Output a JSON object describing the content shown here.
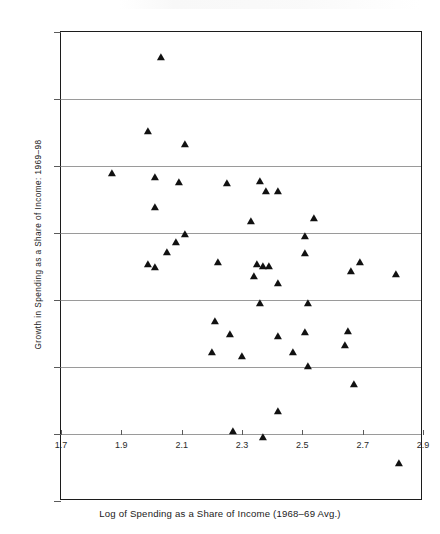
{
  "chart_data": {
    "type": "scatter",
    "title": "",
    "xlabel": "Log of Spending as a Share of Income (1968–69 Avg.)",
    "ylabel": "Growth in Spending as  a  Share of Income: 1969–98",
    "xlim": [
      1.7,
      2.9
    ],
    "ylim": [
      -10,
      60
    ],
    "xticks": [
      "1.7",
      "1.9",
      "2.1",
      "2.3",
      "2.5",
      "2.7",
      "2.9"
    ],
    "xtick_values": [
      1.7,
      1.9,
      2.1,
      2.3,
      2.5,
      2.7,
      2.9
    ],
    "yticks": [
      "60%",
      "50%",
      "40%",
      "30%",
      "20%",
      "10%",
      "0%",
      "-10%"
    ],
    "ytick_values": [
      60,
      50,
      40,
      30,
      20,
      10,
      0,
      -10
    ],
    "grid": "horizontal",
    "legend": "none",
    "marker": "filled-triangle",
    "marker_color": "#111111",
    "points": [
      {
        "x": 2.03,
        "y": 56.2
      },
      {
        "x": 1.99,
        "y": 45.2
      },
      {
        "x": 2.11,
        "y": 43.3
      },
      {
        "x": 1.87,
        "y": 38.9
      },
      {
        "x": 2.01,
        "y": 38.4
      },
      {
        "x": 2.09,
        "y": 37.6
      },
      {
        "x": 2.25,
        "y": 37.4
      },
      {
        "x": 2.36,
        "y": 37.8
      },
      {
        "x": 2.38,
        "y": 36.3
      },
      {
        "x": 2.42,
        "y": 36.3
      },
      {
        "x": 2.01,
        "y": 33.9
      },
      {
        "x": 2.33,
        "y": 31.8
      },
      {
        "x": 2.54,
        "y": 32.2
      },
      {
        "x": 2.11,
        "y": 29.8
      },
      {
        "x": 2.08,
        "y": 28.6
      },
      {
        "x": 2.05,
        "y": 27.2
      },
      {
        "x": 2.51,
        "y": 29.6
      },
      {
        "x": 2.51,
        "y": 27.0
      },
      {
        "x": 1.99,
        "y": 25.3
      },
      {
        "x": 2.01,
        "y": 24.9
      },
      {
        "x": 2.22,
        "y": 25.6
      },
      {
        "x": 2.35,
        "y": 25.4
      },
      {
        "x": 2.37,
        "y": 25.1
      },
      {
        "x": 2.39,
        "y": 25.1
      },
      {
        "x": 2.34,
        "y": 23.6
      },
      {
        "x": 2.42,
        "y": 22.5
      },
      {
        "x": 2.69,
        "y": 25.6
      },
      {
        "x": 2.66,
        "y": 24.3
      },
      {
        "x": 2.81,
        "y": 23.9
      },
      {
        "x": 2.36,
        "y": 19.6
      },
      {
        "x": 2.52,
        "y": 19.6
      },
      {
        "x": 2.21,
        "y": 16.8
      },
      {
        "x": 2.26,
        "y": 14.9
      },
      {
        "x": 2.42,
        "y": 14.6
      },
      {
        "x": 2.51,
        "y": 15.2
      },
      {
        "x": 2.65,
        "y": 15.4
      },
      {
        "x": 2.2,
        "y": 12.3
      },
      {
        "x": 2.3,
        "y": 11.6
      },
      {
        "x": 2.47,
        "y": 12.3
      },
      {
        "x": 2.64,
        "y": 13.3
      },
      {
        "x": 2.52,
        "y": 10.2
      },
      {
        "x": 2.67,
        "y": 7.5
      },
      {
        "x": 2.42,
        "y": 3.5
      },
      {
        "x": 2.27,
        "y": 0.4
      },
      {
        "x": 2.37,
        "y": -0.5
      },
      {
        "x": 2.82,
        "y": -4.3
      }
    ]
  }
}
